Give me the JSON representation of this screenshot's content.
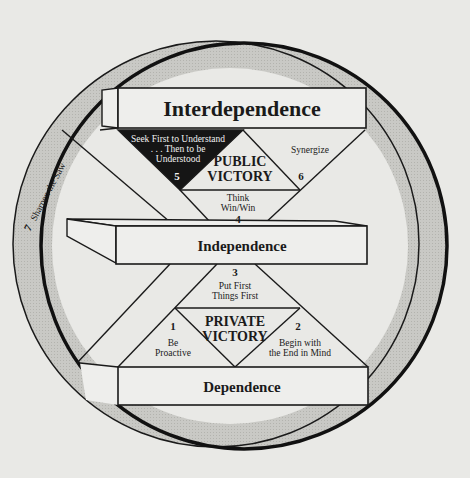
{
  "diagram": {
    "type": "maturity-continuum",
    "levels": {
      "top": "Interdependence",
      "middle": "Independence",
      "bottom": "Dependence"
    },
    "victories": {
      "public": [
        "PUBLIC",
        "VICTORY"
      ],
      "private": [
        "PRIVATE",
        "VICTORY"
      ]
    },
    "habits": [
      {
        "number": "1",
        "lines": [
          "Be",
          "Proactive"
        ]
      },
      {
        "number": "2",
        "lines": [
          "Begin with",
          "the End in Mind"
        ]
      },
      {
        "number": "3",
        "lines": [
          "Put First",
          "Things First"
        ]
      },
      {
        "number": "4",
        "lines": [
          "Think",
          "Win/Win"
        ]
      },
      {
        "number": "5",
        "lines": [
          "Seek First to Understand",
          ". . . Then to be",
          "Understood"
        ]
      },
      {
        "number": "6",
        "lines": [
          "Synergize"
        ]
      },
      {
        "number": "7",
        "lines": [
          "Sharpen the Saw"
        ]
      }
    ],
    "colors": {
      "background": "#e9e9e6",
      "ring": "#c4c4c0",
      "ink": "#1a1a1a",
      "habit5_fill": "#151515"
    }
  }
}
